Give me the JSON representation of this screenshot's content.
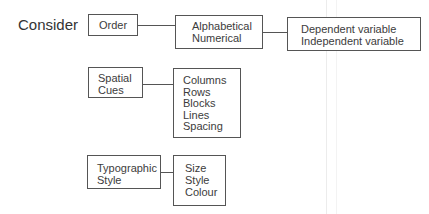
{
  "heading": "Consider",
  "groups": [
    {
      "label_lines": [
        "Order"
      ],
      "options_lines": [
        "Alphabetical",
        "Numerical"
      ],
      "detail_lines": [
        "Dependent variable",
        "Independent variable"
      ]
    },
    {
      "label_lines": [
        "Spatial",
        "Cues"
      ],
      "options_lines": [
        "Columns",
        "Rows",
        "Blocks",
        "Lines",
        "Spacing"
      ]
    },
    {
      "label_lines": [
        "Typographic",
        "Style"
      ],
      "options_lines": [
        "Size",
        "Style",
        "Colour"
      ]
    }
  ]
}
